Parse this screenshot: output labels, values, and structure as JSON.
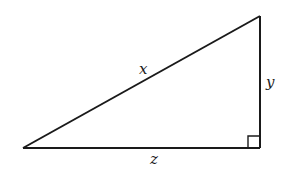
{
  "diagram": {
    "type": "right-triangle",
    "stroke_color": "#1a1a1a",
    "background": "#ffffff",
    "vertices": {
      "left": [
        23,
        148
      ],
      "top_right": [
        260,
        16
      ],
      "right_angle": [
        260,
        148
      ]
    },
    "right_angle_marker_size": 12,
    "labels": {
      "hypotenuse": "x",
      "vertical_leg": "y",
      "horizontal_leg": "z"
    }
  }
}
